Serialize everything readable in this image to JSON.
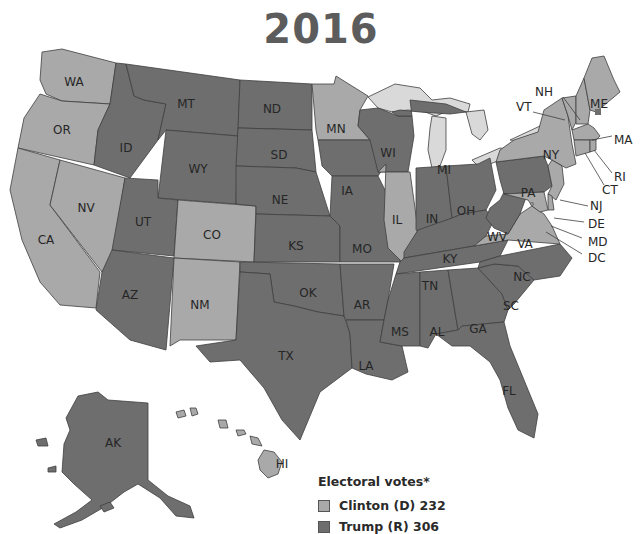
{
  "title": "2016",
  "colors": {
    "trump": "#6e6e6e",
    "clinton": "#a9a9a9",
    "lakes": "#d9d9d9",
    "border": "#3f3f3f",
    "background": "#ffffff"
  },
  "legend": {
    "title": "Electoral votes*",
    "items": [
      {
        "label": "Clinton (D) 232",
        "party": "clinton"
      },
      {
        "label": "Trump (R) 306",
        "party": "trump"
      }
    ]
  },
  "states": {
    "WA": {
      "label": "WA",
      "winner": "clinton"
    },
    "OR": {
      "label": "OR",
      "winner": "clinton"
    },
    "CA": {
      "label": "CA",
      "winner": "clinton"
    },
    "NV": {
      "label": "NV",
      "winner": "clinton"
    },
    "ID": {
      "label": "ID",
      "winner": "trump"
    },
    "MT": {
      "label": "MT",
      "winner": "trump"
    },
    "WY": {
      "label": "WY",
      "winner": "trump"
    },
    "UT": {
      "label": "UT",
      "winner": "trump"
    },
    "AZ": {
      "label": "AZ",
      "winner": "trump"
    },
    "CO": {
      "label": "CO",
      "winner": "clinton"
    },
    "NM": {
      "label": "NM",
      "winner": "clinton"
    },
    "ND": {
      "label": "ND",
      "winner": "trump"
    },
    "SD": {
      "label": "SD",
      "winner": "trump"
    },
    "NE": {
      "label": "NE",
      "winner": "trump"
    },
    "KS": {
      "label": "KS",
      "winner": "trump"
    },
    "OK": {
      "label": "OK",
      "winner": "trump"
    },
    "TX": {
      "label": "TX",
      "winner": "trump"
    },
    "MN": {
      "label": "MN",
      "winner": "clinton"
    },
    "IA": {
      "label": "IA",
      "winner": "trump"
    },
    "MO": {
      "label": "MO",
      "winner": "trump"
    },
    "AR": {
      "label": "AR",
      "winner": "trump"
    },
    "LA": {
      "label": "LA",
      "winner": "trump"
    },
    "WI": {
      "label": "WI",
      "winner": "trump"
    },
    "IL": {
      "label": "IL",
      "winner": "clinton"
    },
    "MI": {
      "label": "MI",
      "winner": "trump"
    },
    "IN": {
      "label": "IN",
      "winner": "trump"
    },
    "OH": {
      "label": "OH",
      "winner": "trump"
    },
    "KY": {
      "label": "KY",
      "winner": "trump"
    },
    "TN": {
      "label": "TN",
      "winner": "trump"
    },
    "MS": {
      "label": "MS",
      "winner": "trump"
    },
    "AL": {
      "label": "AL",
      "winner": "trump"
    },
    "GA": {
      "label": "GA",
      "winner": "trump"
    },
    "FL": {
      "label": "FL",
      "winner": "trump"
    },
    "SC": {
      "label": "SC",
      "winner": "trump"
    },
    "NC": {
      "label": "NC",
      "winner": "trump"
    },
    "VA": {
      "label": "VA",
      "winner": "clinton"
    },
    "WV": {
      "label": "WV",
      "winner": "trump"
    },
    "PA": {
      "label": "PA",
      "winner": "trump"
    },
    "NY": {
      "label": "NY",
      "winner": "clinton"
    },
    "VT": {
      "label": "VT",
      "winner": "clinton"
    },
    "NH": {
      "label": "NH",
      "winner": "clinton"
    },
    "ME": {
      "label": "ME",
      "winner": "clinton",
      "note": "split: 1 district Trump"
    },
    "MA": {
      "label": "MA",
      "winner": "clinton"
    },
    "RI": {
      "label": "RI",
      "winner": "clinton"
    },
    "CT": {
      "label": "CT",
      "winner": "clinton"
    },
    "NJ": {
      "label": "NJ",
      "winner": "clinton"
    },
    "DE": {
      "label": "DE",
      "winner": "clinton"
    },
    "MD": {
      "label": "MD",
      "winner": "clinton"
    },
    "DC": {
      "label": "DC",
      "winner": "clinton"
    },
    "AK": {
      "label": "AK",
      "winner": "trump"
    },
    "HI": {
      "label": "HI",
      "winner": "clinton"
    }
  }
}
